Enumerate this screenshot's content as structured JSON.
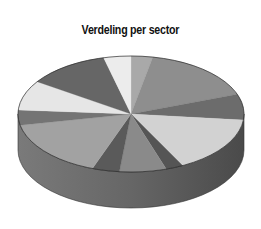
{
  "chart_data": {
    "type": "pie",
    "style": "3d",
    "title": "Verdeling per sector",
    "categories": [
      "S1",
      "S2",
      "S3",
      "S4",
      "S5",
      "S6",
      "S7",
      "S8",
      "S9",
      "S10",
      "S11",
      "S12"
    ],
    "values": [
      3.1,
      16.4,
      7.2,
      15.8,
      2.5,
      6.7,
      3.9,
      16.4,
      4.2,
      8.3,
      11.7,
      3.9
    ],
    "colors": [
      "#a9a9a9",
      "#8e8e8e",
      "#6c6c6c",
      "#d2d2d2",
      "#555555",
      "#8a8a8a",
      "#5a5a5a",
      "#a2a2a2",
      "#747474",
      "#e6e6e6",
      "#666666",
      "#ececec"
    ],
    "legend": "none",
    "labels_shown": false
  },
  "geometry": {
    "cx": 131,
    "cy": 114,
    "rx": 113,
    "ry": 58,
    "depth": 36
  }
}
